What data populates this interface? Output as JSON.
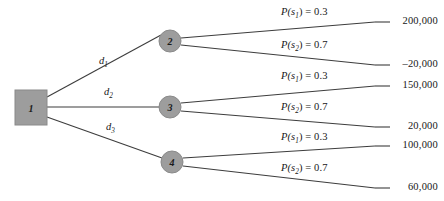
{
  "diagram": {
    "type": "decision-tree",
    "colors": {
      "node_fill": "#9d9d9d",
      "node_stroke": "#8a8a8a",
      "line": "#3d3d3d",
      "text": "#171717",
      "background": "#ffffff"
    },
    "decision_node": {
      "id": "1",
      "shape": "square",
      "label": "1"
    },
    "chance_nodes": [
      {
        "id": "2",
        "shape": "circle",
        "label": "2"
      },
      {
        "id": "3",
        "shape": "circle",
        "label": "3"
      },
      {
        "id": "4",
        "shape": "circle",
        "label": "4"
      }
    ],
    "decision_branches": [
      {
        "key": "d1",
        "base": "d",
        "sub": "1",
        "to_node": "2"
      },
      {
        "key": "d2",
        "base": "d",
        "sub": "2",
        "to_node": "3"
      },
      {
        "key": "d3",
        "base": "d",
        "sub": "3",
        "to_node": "4"
      }
    ],
    "outcome_branches": [
      {
        "from_node": "2",
        "state_var": "P(s",
        "state_sub": "1",
        "state_tail": ") = 0.3",
        "probability": 0.3,
        "payoff": "200,000"
      },
      {
        "from_node": "2",
        "state_var": "P(s",
        "state_sub": "2",
        "state_tail": ") = 0.7",
        "probability": 0.7,
        "payoff": "–20,000"
      },
      {
        "from_node": "3",
        "state_var": "P(s",
        "state_sub": "1",
        "state_tail": ") = 0.3",
        "probability": 0.3,
        "payoff": "150,000"
      },
      {
        "from_node": "3",
        "state_var": "P(s",
        "state_sub": "2",
        "state_tail": ") = 0.7",
        "probability": 0.7,
        "payoff": "20,000"
      },
      {
        "from_node": "4",
        "state_var": "P(s",
        "state_sub": "1",
        "state_tail": ") = 0.3",
        "probability": 0.3,
        "payoff": "100,000"
      },
      {
        "from_node": "4",
        "state_var": "P(s",
        "state_sub": "2",
        "state_tail": ") = 0.7",
        "probability": 0.7,
        "payoff": "60,000"
      }
    ]
  }
}
